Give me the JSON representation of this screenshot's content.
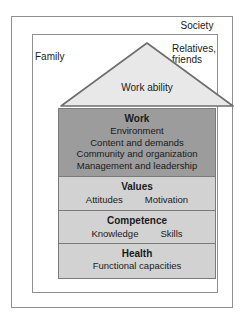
{
  "figure": {
    "society_label": "Society",
    "family_label": "Family",
    "relatives_label_line1": "Relatives,",
    "relatives_label_line2": "friends",
    "roof_label": "Work ability"
  },
  "colors": {
    "outer_border": "#8f8f8f",
    "inner_border": "#8f8f8f",
    "floor_border": "#7a7a7a",
    "roof_fill": "#e8e8e8",
    "roof_stroke": "#6e6e6e",
    "work_fill": "#9c9c9c",
    "lower_floor_fill": "#d2d2d2",
    "text": "#1a1a1a",
    "background": "#ffffff"
  },
  "floors": [
    {
      "id": "work",
      "title": "Work",
      "lines": [
        "Environment",
        "Content and demands",
        "Community and organization",
        "Management and leadership"
      ],
      "pair": []
    },
    {
      "id": "values",
      "title": "Values",
      "lines": [],
      "pair": [
        "Attitudes",
        "Motivation"
      ]
    },
    {
      "id": "competence",
      "title": "Competence",
      "lines": [],
      "pair": [
        "Knowledge",
        "Skills"
      ]
    },
    {
      "id": "health",
      "title": "Health",
      "lines": [
        "Functional capacities"
      ],
      "pair": []
    }
  ]
}
